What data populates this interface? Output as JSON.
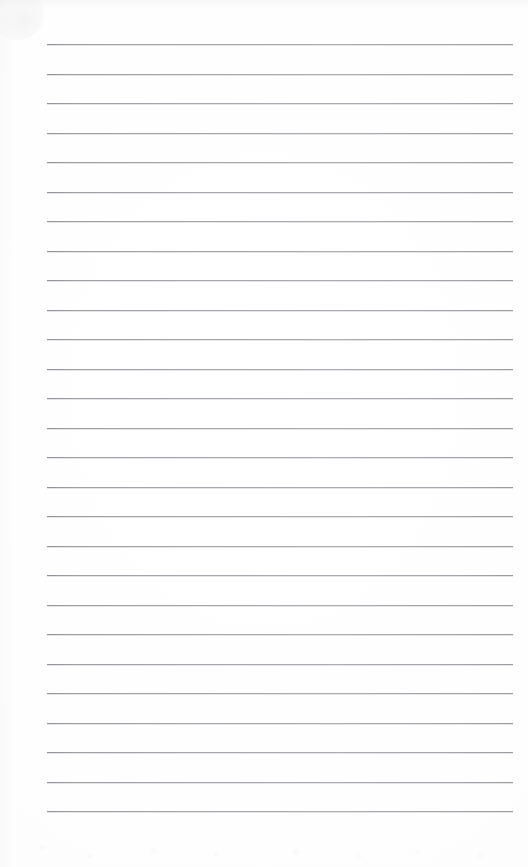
{
  "document": {
    "kind": "scanned-ruled-notepad-page",
    "title": "Blank ruled notepad page",
    "content_text": "",
    "is_blank": true,
    "page_width": 528,
    "page_height": 867,
    "paper_color": "#fefefe",
    "rule_color": "#9a9aa0"
  },
  "ruling": {
    "line_count": 27,
    "first_line_y": 44,
    "line_spacing": 29.5,
    "line_left_x": 47,
    "line_right_x": 513,
    "line_thickness": 1,
    "lines_y": [
      44,
      73.5,
      103,
      132.5,
      162,
      191.5,
      221,
      250.5,
      280,
      309.5,
      339,
      368.5,
      398,
      427.5,
      457,
      486.5,
      516,
      545.5,
      575,
      604.5,
      634,
      663.5,
      693,
      722.5,
      752,
      781.5,
      811
    ]
  },
  "margins": {
    "top_margin": 44,
    "bottom_margin": 56,
    "left_margin": 47,
    "right_margin": 15
  },
  "scan_artifacts": {
    "top_band": "faint gray shadow band along top edge",
    "corner_smudge": "faint smudge at top-left corner",
    "bottom_speckle": "faint dust speckle near bottom edge",
    "left_edge_shading": "subtle vertical shading at left edge"
  }
}
